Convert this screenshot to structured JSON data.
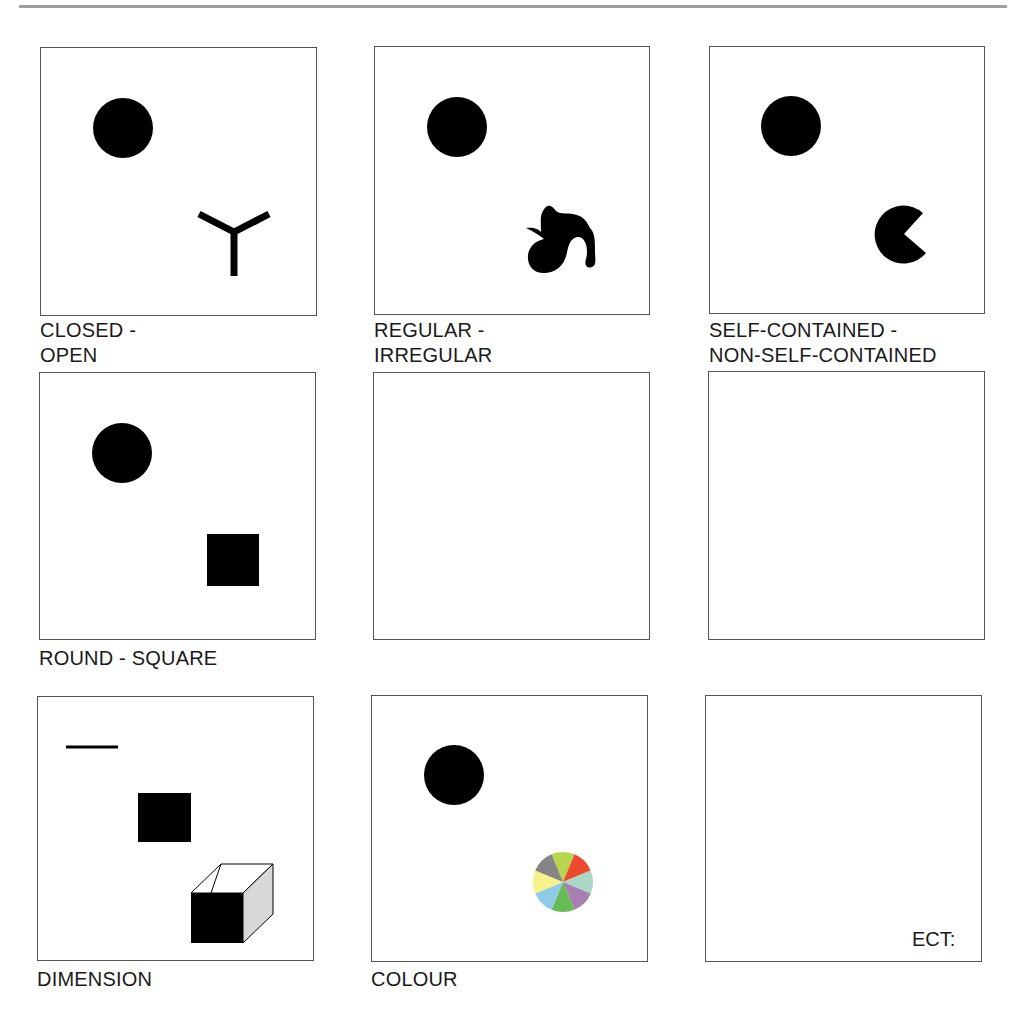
{
  "page": {
    "rule_color": "#a0a0a0",
    "panels": [
      {
        "id": "closed-open",
        "label_line1": "CLOSED -",
        "label_line2": "OPEN",
        "shapes": [
          "filled-circle",
          "y-shaped-open-figure"
        ]
      },
      {
        "id": "regular-irregular",
        "label_line1": "REGULAR -",
        "label_line2": "IRREGULAR",
        "shapes": [
          "filled-circle",
          "irregular-blob"
        ]
      },
      {
        "id": "self-contained",
        "label_line1": "SELF-CONTAINED -",
        "label_line2": "NON-SELF-CONTAINED",
        "shapes": [
          "filled-circle",
          "circle-with-wedge-cut"
        ]
      },
      {
        "id": "round-square",
        "label_line1": "ROUND - SQUARE",
        "shapes": [
          "filled-circle",
          "filled-square"
        ]
      },
      {
        "id": "empty-1",
        "shapes": []
      },
      {
        "id": "empty-2",
        "shapes": []
      },
      {
        "id": "dimension",
        "label_line1": "DIMENSION",
        "shapes": [
          "line-1d",
          "filled-square-2d",
          "cube-3d"
        ]
      },
      {
        "id": "colour",
        "label_line1": "COLOUR",
        "shapes": [
          "filled-circle",
          "colour-wheel"
        ],
        "wheel_colors": [
          "#b5d64e",
          "#ee4b2e",
          "#a9d8c7",
          "#a77fb0",
          "#66bb55",
          "#8fcbe6",
          "#f7f28a",
          "#858585"
        ]
      },
      {
        "id": "ect",
        "inner_text": "ECT:",
        "shapes": []
      }
    ]
  }
}
